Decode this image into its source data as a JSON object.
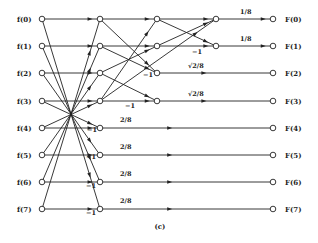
{
  "caption": "(c)",
  "inputs": [
    "f(0)",
    "f(1)",
    "f(2)",
    "f(3)",
    "f(4)",
    "f(5)",
    "f(6)",
    "f(7)"
  ],
  "outputs": [
    "F(0)",
    "F(1)",
    "F(2)",
    "F(3)",
    "F(4)",
    "F(5)",
    "F(6)",
    "F(7)"
  ],
  "columns_x": [
    42,
    100,
    157,
    216,
    273
  ],
  "rows_y": [
    19,
    46,
    73,
    101,
    128,
    155,
    182,
    209
  ],
  "edges": [
    {
      "from": [
        0,
        0
      ],
      "to": [
        1,
        0
      ]
    },
    {
      "from": [
        0,
        7
      ],
      "to": [
        1,
        0
      ]
    },
    {
      "from": [
        0,
        1
      ],
      "to": [
        1,
        1
      ]
    },
    {
      "from": [
        0,
        6
      ],
      "to": [
        1,
        1
      ]
    },
    {
      "from": [
        0,
        2
      ],
      "to": [
        1,
        2
      ]
    },
    {
      "from": [
        0,
        5
      ],
      "to": [
        1,
        2
      ]
    },
    {
      "from": [
        0,
        3
      ],
      "to": [
        1,
        3
      ]
    },
    {
      "from": [
        0,
        4
      ],
      "to": [
        1,
        3
      ]
    },
    {
      "from": [
        0,
        3
      ],
      "to": [
        1,
        4
      ]
    },
    {
      "from": [
        0,
        4
      ],
      "to": [
        1,
        4
      ]
    },
    {
      "from": [
        0,
        2
      ],
      "to": [
        1,
        5
      ]
    },
    {
      "from": [
        0,
        5
      ],
      "to": [
        1,
        5
      ]
    },
    {
      "from": [
        0,
        1
      ],
      "to": [
        1,
        6
      ]
    },
    {
      "from": [
        0,
        6
      ],
      "to": [
        1,
        6
      ]
    },
    {
      "from": [
        0,
        0
      ],
      "to": [
        1,
        7
      ]
    },
    {
      "from": [
        0,
        7
      ],
      "to": [
        1,
        7
      ]
    },
    {
      "from": [
        1,
        0
      ],
      "to": [
        2,
        0
      ]
    },
    {
      "from": [
        1,
        3
      ],
      "to": [
        2,
        0
      ]
    },
    {
      "from": [
        1,
        1
      ],
      "to": [
        2,
        1
      ]
    },
    {
      "from": [
        1,
        2
      ],
      "to": [
        2,
        1
      ]
    },
    {
      "from": [
        1,
        1
      ],
      "to": [
        2,
        2
      ]
    },
    {
      "from": [
        1,
        2
      ],
      "to": [
        2,
        3
      ]
    },
    {
      "from": [
        1,
        0
      ],
      "to": [
        2,
        2
      ]
    },
    {
      "from": [
        1,
        3
      ],
      "to": [
        2,
        3
      ]
    },
    {
      "from": [
        2,
        0
      ],
      "to": [
        3,
        0
      ]
    },
    {
      "from": [
        2,
        1
      ],
      "to": [
        3,
        0
      ]
    },
    {
      "from": [
        2,
        0
      ],
      "to": [
        3,
        1
      ]
    },
    {
      "from": [
        2,
        1
      ],
      "to": [
        3,
        1
      ]
    },
    {
      "from": [
        1,
        3
      ],
      "to": [
        3,
        0
      ]
    },
    {
      "from": [
        2,
        2
      ],
      "to": [
        4,
        2
      ]
    },
    {
      "from": [
        2,
        3
      ],
      "to": [
        4,
        3
      ]
    },
    {
      "from": [
        3,
        0
      ],
      "to": [
        4,
        0
      ]
    },
    {
      "from": [
        3,
        1
      ],
      "to": [
        4,
        1
      ]
    },
    {
      "from": [
        1,
        4
      ],
      "to": [
        4,
        4
      ]
    },
    {
      "from": [
        1,
        5
      ],
      "to": [
        4,
        5
      ]
    },
    {
      "from": [
        1,
        6
      ],
      "to": [
        4,
        6
      ]
    },
    {
      "from": [
        1,
        7
      ],
      "to": [
        4,
        7
      ]
    }
  ],
  "gains": [
    {
      "text": "1/8",
      "x": 240,
      "y": 14
    },
    {
      "text": "1/8",
      "x": 240,
      "y": 41
    },
    {
      "text": "−1",
      "x": 192,
      "y": 54
    },
    {
      "text": "√2/8",
      "x": 188,
      "y": 68
    },
    {
      "text": "√2/8",
      "x": 188,
      "y": 96
    },
    {
      "text": "−1",
      "x": 143,
      "y": 77
    },
    {
      "text": "−1",
      "x": 125,
      "y": 108
    },
    {
      "text": "2/8",
      "x": 120,
      "y": 122
    },
    {
      "text": "2/8",
      "x": 120,
      "y": 149
    },
    {
      "text": "2/8",
      "x": 120,
      "y": 176
    },
    {
      "text": "2/8",
      "x": 120,
      "y": 203
    },
    {
      "text": "−1",
      "x": 87,
      "y": 132
    },
    {
      "text": "−1",
      "x": 86,
      "y": 159
    },
    {
      "text": "−1",
      "x": 86,
      "y": 188
    },
    {
      "text": "−1",
      "x": 86,
      "y": 215
    }
  ]
}
